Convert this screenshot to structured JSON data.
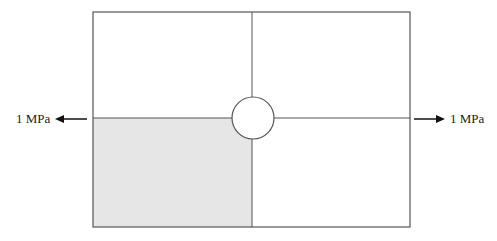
{
  "diagram": {
    "left_load": {
      "label": "1 MPa",
      "direction": "left"
    },
    "right_load": {
      "label": "1 MPa",
      "direction": "right"
    },
    "plate": {
      "quadrants": [
        "top-left",
        "top-right",
        "bottom-left",
        "bottom-right"
      ],
      "shaded_quadrant": "bottom-left",
      "has_central_hole": true
    },
    "colors": {
      "line": "#555555",
      "shade": "#e6e6e6",
      "background": "#ffffff"
    }
  }
}
